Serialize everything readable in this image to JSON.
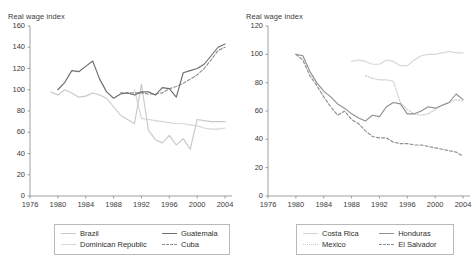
{
  "colors": {
    "dark": "#6e6e6e",
    "mid": "#8f8f8f",
    "light": "#c9c9c9",
    "lighter": "#d6d6d6",
    "axis": "#7a7a7a",
    "text": "#333333",
    "legend_border": "#b9b9b9"
  },
  "chart_data": [
    {
      "type": "line",
      "title": "",
      "ylabel": "Real wage index",
      "xlabel": "",
      "xlim": [
        1976,
        2005
      ],
      "ylim": [
        0,
        160
      ],
      "yticks": [
        0,
        20,
        40,
        60,
        80,
        100,
        120,
        140,
        160
      ],
      "xticks": [
        1976,
        1980,
        1984,
        1988,
        1992,
        1996,
        2000,
        2004
      ],
      "grid": false,
      "legend_position": "bottom",
      "series": [
        {
          "name": "Brazil",
          "style": "solid",
          "color": "#c9c9c9",
          "x": [
            1979,
            1980,
            1981,
            1982,
            1983,
            1984,
            1985,
            1986,
            1987,
            1988,
            1989,
            1990,
            1991,
            1992,
            1993,
            1994,
            1995,
            1996,
            1997,
            1998,
            1999,
            2000,
            2001,
            2002,
            2003,
            2004
          ],
          "values": [
            98,
            95,
            100,
            97,
            93,
            94,
            97,
            95,
            92,
            84,
            76,
            72,
            68,
            105,
            62,
            53,
            50,
            57,
            48,
            54,
            44,
            72,
            71,
            70,
            70,
            70
          ]
        },
        {
          "name": "Dominican Republic",
          "style": "solid",
          "color": "#d6d6d6",
          "x": [
            1991,
            1992,
            1993,
            1994,
            1995,
            1996,
            1997,
            1998,
            1999,
            2000,
            2001,
            2002,
            2003,
            2004
          ],
          "values": [
            100,
            73,
            72,
            71,
            70,
            69,
            68,
            68,
            67,
            66,
            64,
            63,
            63,
            64
          ]
        },
        {
          "name": "Guatemala",
          "style": "solid",
          "color": "#6e6e6e",
          "x": [
            1980,
            1981,
            1982,
            1983,
            1984,
            1985,
            1986,
            1987,
            1988,
            1989,
            1990,
            1991,
            1992,
            1993,
            1994,
            1995,
            1996,
            1997,
            1998,
            1999,
            2000,
            2001,
            2002,
            2003,
            2004
          ],
          "values": [
            100,
            107,
            118,
            117,
            122,
            127,
            110,
            98,
            92,
            96,
            97,
            95,
            98,
            98,
            95,
            102,
            101,
            93,
            116,
            118,
            120,
            124,
            132,
            140,
            143
          ]
        },
        {
          "name": "Cuba",
          "style": "dashed",
          "color": "#8f8f8f",
          "x": [
            1989,
            1990,
            1991,
            1992,
            1993,
            1994,
            1995,
            1996,
            1997,
            1998,
            1999,
            2000,
            2001,
            2002,
            2003,
            2004
          ],
          "values": [
            97,
            97,
            97,
            97,
            96,
            96,
            97,
            101,
            103,
            106,
            110,
            114,
            120,
            128,
            137,
            140
          ]
        }
      ]
    },
    {
      "type": "line",
      "title": "",
      "ylabel": "Real wage index",
      "xlabel": "",
      "xlim": [
        1976,
        2005
      ],
      "ylim": [
        0,
        120
      ],
      "yticks": [
        0,
        20,
        40,
        60,
        80,
        100,
        120
      ],
      "xticks": [
        1976,
        1980,
        1984,
        1988,
        1992,
        1996,
        2000,
        2004
      ],
      "grid": false,
      "legend_position": "bottom",
      "series": [
        {
          "name": "Costa Rica",
          "style": "solid",
          "color": "#d6d6d6",
          "x": [
            1988,
            1989,
            1990,
            1991,
            1992,
            1993,
            1994,
            1995,
            1996,
            1997,
            1998,
            1999,
            2000,
            2001,
            2002,
            2003,
            2004
          ],
          "values": [
            95,
            96,
            95,
            93,
            93,
            96,
            95,
            92,
            92,
            96,
            99,
            100,
            100,
            101,
            102,
            101,
            101
          ]
        },
        {
          "name": "Mexico",
          "style": "dotted",
          "color": "#c9c9c9",
          "x": [
            1990,
            1991,
            1992,
            1993,
            1994,
            1995,
            1996,
            1997,
            1998,
            1999,
            2000,
            2001,
            2002,
            2003,
            2004
          ],
          "values": [
            85,
            83,
            82,
            82,
            81,
            66,
            61,
            58,
            57,
            58,
            61,
            64,
            66,
            68,
            67
          ]
        },
        {
          "name": "Honduras",
          "style": "solid",
          "color": "#8f8f8f",
          "x": [
            1980,
            1981,
            1982,
            1983,
            1984,
            1985,
            1986,
            1987,
            1988,
            1989,
            1990,
            1991,
            1992,
            1993,
            1994,
            1995,
            1996,
            1997,
            1998,
            1999,
            2000,
            2001,
            2002,
            2003,
            2004
          ],
          "values": [
            100,
            99,
            88,
            80,
            74,
            70,
            65,
            62,
            58,
            55,
            53,
            57,
            56,
            63,
            66,
            65,
            58,
            58,
            60,
            63,
            62,
            64,
            66,
            72,
            68
          ]
        },
        {
          "name": "El Salvador",
          "style": "dashed",
          "color": "#8f8f8f",
          "x": [
            1980,
            1981,
            1982,
            1983,
            1984,
            1985,
            1986,
            1987,
            1988,
            1989,
            1990,
            1991,
            1992,
            1993,
            1994,
            1995,
            1996,
            1997,
            1998,
            1999,
            2000,
            2001,
            2002,
            2003,
            2004
          ],
          "values": [
            100,
            96,
            85,
            78,
            70,
            63,
            57,
            60,
            54,
            51,
            46,
            42,
            41,
            41,
            38,
            37,
            37,
            36,
            36,
            35,
            34,
            33,
            32,
            31,
            28
          ]
        }
      ]
    }
  ],
  "panels": [
    {
      "ylabel": "Real wage index",
      "legend": [
        {
          "label": "Brazil",
          "style": "solid",
          "color": "#c9c9c9"
        },
        {
          "label": "Guatemala",
          "style": "solid",
          "color": "#6e6e6e"
        },
        {
          "label": "Dominican Republic",
          "style": "solid",
          "color": "#d6d6d6"
        },
        {
          "label": "Cuba",
          "style": "dashed",
          "color": "#8f8f8f"
        }
      ]
    },
    {
      "ylabel": "Real wage index",
      "legend": [
        {
          "label": "Costa Rica",
          "style": "solid",
          "color": "#d6d6d6"
        },
        {
          "label": "Honduras",
          "style": "solid",
          "color": "#8f8f8f"
        },
        {
          "label": "Mexico",
          "style": "dotted",
          "color": "#c9c9c9"
        },
        {
          "label": "El Salvador",
          "style": "dashed",
          "color": "#8f8f8f"
        }
      ]
    }
  ]
}
